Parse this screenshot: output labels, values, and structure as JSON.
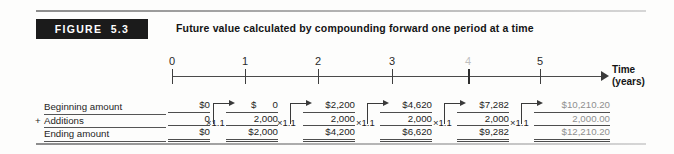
{
  "figure": {
    "badge_label": "FIGURE  5.3",
    "title": "Future value calculated by compounding forward one period at a time"
  },
  "axis": {
    "label_line1": "Time",
    "label_line2": "(years)",
    "ticks": [
      {
        "label": "0",
        "x": 172,
        "faded": false
      },
      {
        "label": "1",
        "x": 245,
        "faded": false
      },
      {
        "label": "2",
        "x": 318,
        "faded": false
      },
      {
        "label": "3",
        "x": 392,
        "faded": false
      },
      {
        "label": "4",
        "x": 468,
        "faded": true
      },
      {
        "label": "5",
        "x": 540,
        "faded": false
      }
    ]
  },
  "row_labels": {
    "beginning": "Beginning amount",
    "plus_sign": "+",
    "additions": "Additions",
    "ending": "Ending amount"
  },
  "multiplier": "×1.1",
  "columns": [
    {
      "year": "0",
      "left": 168,
      "width": 42,
      "dim": false,
      "beginning": "$0",
      "additions": "0",
      "ending": "$0",
      "mult_left": 206,
      "mult_top": 117
    },
    {
      "year": "1",
      "left": 226,
      "width": 52,
      "dim": false,
      "beginning": "$      0",
      "additions": "2,000",
      "ending": "$2,000",
      "mult_left": 277,
      "mult_top": 117
    },
    {
      "year": "2",
      "left": 303,
      "width": 52,
      "dim": false,
      "beginning": "$2,200",
      "additions": "2,000",
      "ending": "$4,200",
      "mult_left": 356,
      "mult_top": 117
    },
    {
      "year": "3",
      "left": 380,
      "width": 52,
      "dim": false,
      "beginning": "$4,620",
      "additions": "2,000",
      "ending": "$6,620",
      "mult_left": 433,
      "mult_top": 117
    },
    {
      "year": "4",
      "left": 457,
      "width": 52,
      "dim": false,
      "beginning": "$7,282",
      "additions": "2,000",
      "ending": "$9,282",
      "mult_left": 510,
      "mult_top": 117
    },
    {
      "year": "5",
      "left": 534,
      "width": 76,
      "dim": true,
      "beginning": "$10,210.20",
      "additions": "2,000.00",
      "ending": "$12,210.20",
      "mult_left": null,
      "mult_top": null
    }
  ],
  "connectors": [
    {
      "left": 213,
      "bottom_y": 124,
      "rise": 21,
      "run": 16
    },
    {
      "left": 290,
      "bottom_y": 124,
      "rise": 21,
      "run": 16
    },
    {
      "left": 367,
      "bottom_y": 124,
      "rise": 21,
      "run": 16
    },
    {
      "left": 444,
      "bottom_y": 124,
      "rise": 21,
      "run": 16
    },
    {
      "left": 521,
      "bottom_y": 124,
      "rise": 21,
      "run": 16
    }
  ],
  "chart_data": {
    "type": "table",
    "title": "Future value calculated by compounding forward one period at a time",
    "xlabel": "Time (years)",
    "categories": [
      "0",
      "1",
      "2",
      "3",
      "4",
      "5"
    ],
    "growth_factor": 1.1,
    "annual_addition": 2000,
    "series": [
      {
        "name": "Beginning amount",
        "values": [
          0,
          0,
          2200,
          4620,
          7282,
          10210.2
        ]
      },
      {
        "name": "Additions",
        "values": [
          0,
          2000,
          2000,
          2000,
          2000,
          2000
        ]
      },
      {
        "name": "Ending amount",
        "values": [
          0,
          2000,
          4200,
          6620,
          9282,
          12210.2
        ]
      }
    ]
  }
}
